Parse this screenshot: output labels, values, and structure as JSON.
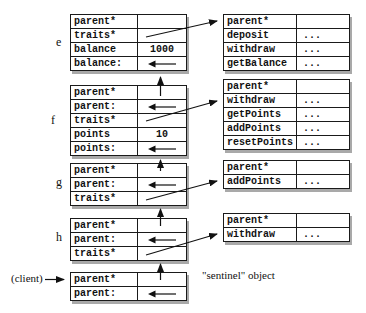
{
  "diagram": {
    "labels": {
      "e": "e",
      "f": "f",
      "g": "g",
      "h": "h",
      "client": "(client)",
      "sentinel": "\"sentinel\" object"
    },
    "colors": {
      "border": "#1a1a1a",
      "shadow": "#a9a9a9",
      "text": "#111111",
      "background": "#ffffff"
    },
    "icons": {
      "left_arrow": "←",
      "up_arrow": "↑",
      "right_arrow": "→"
    }
  },
  "tables": {
    "e": {
      "rows": [
        {
          "name": "parent*",
          "value": ""
        },
        {
          "name": "traits*",
          "value": ""
        },
        {
          "name": "balance",
          "value": "1000"
        },
        {
          "name": "balance:",
          "value": ""
        }
      ]
    },
    "f": {
      "rows": [
        {
          "name": "parent*",
          "value": ""
        },
        {
          "name": "parent:",
          "value": ""
        },
        {
          "name": "traits*",
          "value": ""
        },
        {
          "name": "points",
          "value": "10"
        },
        {
          "name": "points:",
          "value": ""
        }
      ]
    },
    "g": {
      "rows": [
        {
          "name": "parent*",
          "value": ""
        },
        {
          "name": "parent:",
          "value": ""
        },
        {
          "name": "traits*",
          "value": ""
        }
      ]
    },
    "h": {
      "rows": [
        {
          "name": "parent*",
          "value": ""
        },
        {
          "name": "parent:",
          "value": ""
        },
        {
          "name": "traits*",
          "value": ""
        }
      ]
    },
    "sentinel": {
      "rows": [
        {
          "name": "parent*",
          "value": ""
        },
        {
          "name": "parent:",
          "value": ""
        }
      ]
    },
    "trait1": {
      "rows": [
        {
          "name": "parent*",
          "value": ""
        },
        {
          "name": "deposit",
          "value": "..."
        },
        {
          "name": "withdraw",
          "value": "..."
        },
        {
          "name": "getBalance",
          "value": "..."
        }
      ]
    },
    "trait2": {
      "rows": [
        {
          "name": "parent*",
          "value": ""
        },
        {
          "name": "withdraw",
          "value": "..."
        },
        {
          "name": "getPoints",
          "value": "..."
        },
        {
          "name": "addPoints",
          "value": "..."
        },
        {
          "name": "resetPoints",
          "value": "..."
        }
      ]
    },
    "trait3": {
      "rows": [
        {
          "name": "parent*",
          "value": ""
        },
        {
          "name": "addPoints",
          "value": "..."
        }
      ]
    },
    "trait4": {
      "rows": [
        {
          "name": "parent*",
          "value": ""
        },
        {
          "name": "withdraw",
          "value": "..."
        }
      ]
    }
  }
}
